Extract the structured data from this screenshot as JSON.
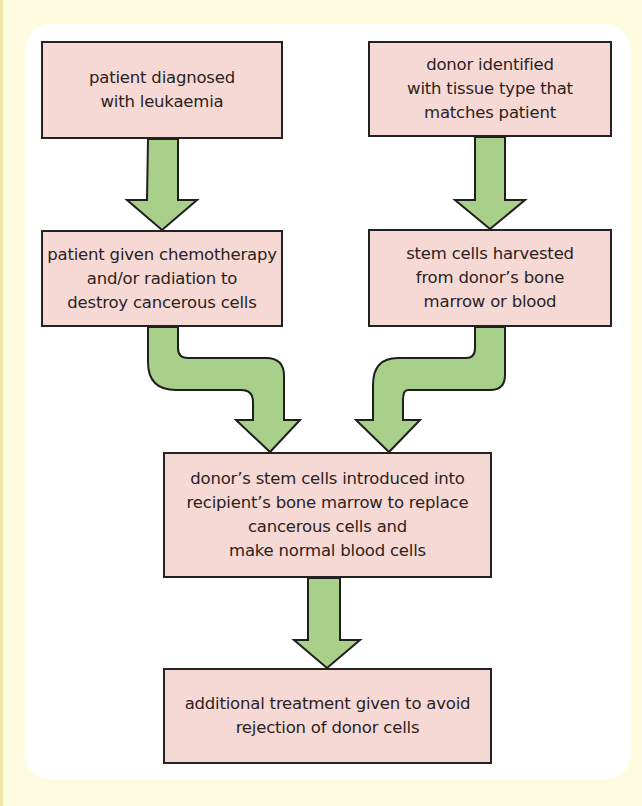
{
  "diagram": {
    "type": "flowchart",
    "colors": {
      "page_background": "#fdfbe0",
      "panel_background": "#ffffff",
      "box_fill": "#f6d9d4",
      "box_border": "#222222",
      "arrow_fill": "#a8d08a",
      "arrow_stroke": "#1f1f1f",
      "text": "#2b2222"
    },
    "nodes": [
      {
        "id": "box1",
        "label": "patient diagnosed\nwith leukaemia"
      },
      {
        "id": "box2",
        "label": "donor identified\nwith tissue type that\nmatches patient"
      },
      {
        "id": "box3",
        "label": "patient given chemotherapy\nand/or radiation to\ndestroy cancerous cells"
      },
      {
        "id": "box4",
        "label": "stem cells harvested\nfrom donor’s bone\nmarrow or blood"
      },
      {
        "id": "box5",
        "label": "donor’s stem cells introduced into\nrecipient’s bone marrow to replace\ncancerous cells and\nmake normal blood cells"
      },
      {
        "id": "box6",
        "label": "additional treatment given to avoid\nrejection of donor cells"
      }
    ],
    "edges": [
      {
        "from": "box1",
        "to": "box3",
        "style": "straight-down-arrow"
      },
      {
        "from": "box2",
        "to": "box4",
        "style": "straight-down-arrow"
      },
      {
        "from": "box3",
        "to": "box5",
        "style": "s-curve-arrow-right"
      },
      {
        "from": "box4",
        "to": "box5",
        "style": "s-curve-arrow-left"
      },
      {
        "from": "box5",
        "to": "box6",
        "style": "straight-down-arrow"
      }
    ]
  }
}
